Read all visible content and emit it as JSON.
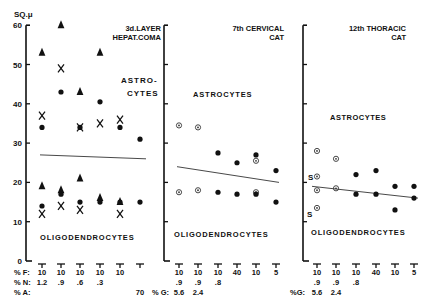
{
  "chart_data": [
    {
      "type": "scatter",
      "panel": "left",
      "title": [
        "3d.LAYER",
        "HEPAT.COMA"
      ],
      "ylabel": "SQ.μ",
      "ylim": [
        0,
        60
      ],
      "yticks": [
        0,
        10,
        20,
        30,
        40,
        50,
        60
      ],
      "group_labels": {
        "upper": [
          "ASTRO-",
          "CYTES"
        ],
        "lower": "OLIGODENDROCYTES"
      },
      "x_conditions": {
        "F": [
          "10",
          "10",
          "10",
          "10",
          "10",
          ""
        ],
        "N": [
          "1.2",
          ".9",
          ".6",
          ".3",
          "",
          ""
        ],
        "A": [
          "",
          "",
          "",
          "",
          "",
          "70"
        ]
      },
      "trend_line": {
        "from": 27,
        "to": 26
      },
      "series": [
        {
          "name": "triangle",
          "marker": "triangle",
          "astrocytes": [
            53,
            60,
            43,
            53,
            null,
            null
          ],
          "oligodendrocytes": [
            19,
            18,
            21,
            16,
            15,
            null
          ]
        },
        {
          "name": "cross",
          "marker": "x",
          "astrocytes": [
            37,
            49,
            34,
            35,
            36,
            null
          ],
          "oligodendrocytes": [
            12,
            14,
            13,
            null,
            12,
            null
          ]
        },
        {
          "name": "dot",
          "marker": "dot",
          "astrocytes": [
            34,
            43,
            34,
            40.5,
            34,
            31
          ],
          "oligodendrocytes": [
            14,
            17,
            15,
            15,
            15,
            15
          ]
        }
      ]
    },
    {
      "type": "scatter",
      "panel": "middle",
      "title": [
        "7th CERVICAL",
        "CAT"
      ],
      "ylim": [
        0,
        60
      ],
      "group_labels": {
        "upper": "ASTROCYTES",
        "lower": "OLIGODENDROCYTES"
      },
      "x_conditions": {
        "F": [
          "10",
          "10",
          "10",
          "40",
          "10",
          "5"
        ],
        "N": [
          ".9",
          ".9",
          ".8",
          "",
          "",
          ""
        ],
        "G": [
          "5.6",
          "2.4",
          "",
          "",
          "",
          ""
        ]
      },
      "trend_line": {
        "from": 24,
        "to": 20
      },
      "series": [
        {
          "name": "circled-dot",
          "marker": "circled",
          "astrocytes": [
            34.5,
            34,
            null,
            null,
            25.5,
            null
          ],
          "oligodendrocytes": [
            17.5,
            18,
            null,
            null,
            17.5,
            null
          ]
        },
        {
          "name": "dot",
          "marker": "dot",
          "astrocytes": [
            null,
            null,
            27.5,
            25,
            27,
            23
          ],
          "oligodendrocytes": [
            null,
            null,
            17.5,
            17,
            17,
            15
          ]
        }
      ]
    },
    {
      "type": "scatter",
      "panel": "right",
      "title": [
        "12th THORACIC",
        "CAT"
      ],
      "ylim": [
        0,
        60
      ],
      "group_labels": {
        "upper": "ASTROCYTES",
        "lower": "OLIGODENDROCYTES"
      },
      "x_conditions": {
        "F": [
          "10",
          "10",
          "10",
          "40",
          "10",
          "5"
        ],
        "N": [
          ".9",
          ".9",
          ".8",
          "",
          "",
          ""
        ],
        "G": [
          "5.6",
          "2.4",
          "",
          "",
          "",
          ""
        ]
      },
      "trend_line": {
        "from": 19,
        "to": 16
      },
      "annotations": [
        {
          "text": "S",
          "value": 21.5
        },
        {
          "text": "S",
          "value": 13.5
        }
      ],
      "series": [
        {
          "name": "circled-dot",
          "marker": "circled",
          "astrocytes": [
            28,
            26,
            null,
            null,
            null,
            null
          ],
          "oligodendrocytes": [
            18,
            18.5,
            null,
            null,
            null,
            null
          ],
          "s_points": [
            21.5,
            13.5
          ]
        },
        {
          "name": "dot",
          "marker": "dot",
          "astrocytes": [
            null,
            null,
            22,
            23,
            19,
            19
          ],
          "oligodendrocytes": [
            null,
            null,
            17,
            17,
            13,
            16
          ]
        }
      ]
    }
  ],
  "labels": {
    "ylabel": "SQ.μ",
    "yticks": [
      "60",
      "50",
      "40",
      "30",
      "20",
      "10",
      "0"
    ],
    "p1_title1": "3d.LAYER",
    "p1_title2": "HEPAT.COMA",
    "p1_astro1": "ASTRO-",
    "p1_astro2": "CYTES",
    "p1_oligo": "OLIGODENDROCYTES",
    "p2_title1": "7th CERVICAL",
    "p2_title2": "CAT",
    "p2_astro": "ASTROCYTES",
    "p2_oligo": "OLIGODENDROCYTES",
    "p3_title1": "12th THORACIC",
    "p3_title2": "CAT",
    "p3_astro": "ASTROCYTES",
    "p3_oligo": "OLIGODENDROCYTES",
    "s_marker": "S",
    "row_f": "% F:",
    "row_n": "% N:",
    "row_a": "% A:",
    "row_g2": "% G:",
    "row_g3": "%G:",
    "p1_f": [
      "10",
      "10",
      "10",
      "10",
      "10"
    ],
    "p1_n": [
      "1.2",
      ".9",
      ".6",
      ".3"
    ],
    "p1_a": "70",
    "p2_f": [
      "10",
      "10",
      "10",
      "40",
      "10",
      "5"
    ],
    "p2_n": [
      ".9",
      ".9",
      ".8"
    ],
    "p2_g": [
      "5.6",
      "2.4"
    ],
    "p3_f": [
      "10",
      "10",
      "10",
      "40",
      "10",
      "5"
    ],
    "p3_n": [
      ".9",
      ".9",
      ".8"
    ],
    "p3_g": [
      "5.6",
      "2.4"
    ]
  }
}
